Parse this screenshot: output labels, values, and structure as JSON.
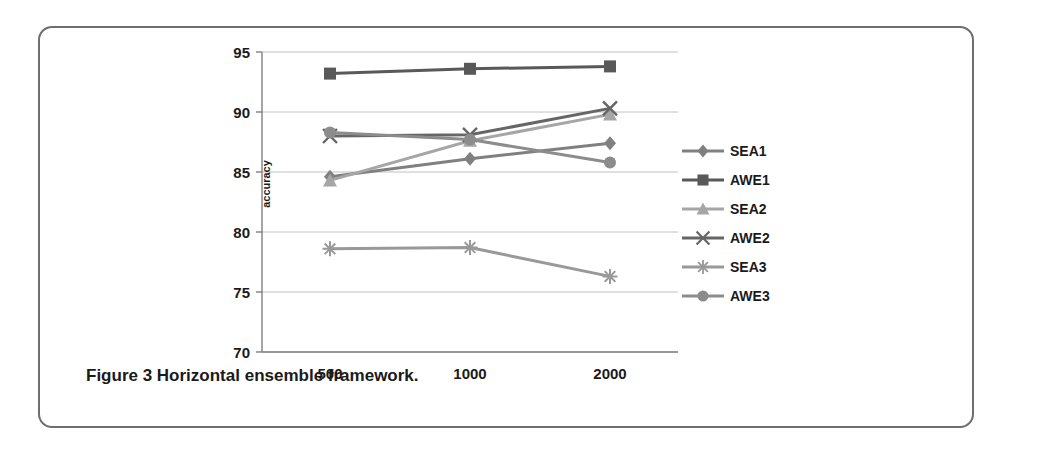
{
  "figure": {
    "caption": "Figure 3 Horizontal ensemble framework."
  },
  "colors": {
    "sea1": "#808080",
    "awe1": "#595959",
    "sea2": "#a6a6a6",
    "awe2": "#666666",
    "sea3": "#999999",
    "awe3": "#8c8c8c",
    "axis": "#808080",
    "grid": "#c0c0c0",
    "text": "#1a1a1a",
    "border": "#6e6e6e"
  },
  "chart_data": {
    "type": "line",
    "title": "",
    "xlabel": "",
    "ylabel": "accuracy",
    "categories": [
      "500",
      "1000",
      "2000"
    ],
    "x": [
      500,
      1000,
      2000
    ],
    "ylim": [
      70,
      95
    ],
    "yticks": [
      "70",
      "75",
      "80",
      "85",
      "90",
      "95"
    ],
    "xticks": [
      "500",
      "1000",
      "2000"
    ],
    "grid": true,
    "legend_position": "right",
    "series": [
      {
        "name": "SEA1",
        "marker": "diamond",
        "values": [
          84.6,
          86.1,
          87.4
        ]
      },
      {
        "name": "AWE1",
        "marker": "square",
        "values": [
          93.2,
          93.6,
          93.8
        ]
      },
      {
        "name": "SEA2",
        "marker": "triangle",
        "values": [
          84.3,
          87.6,
          89.8
        ]
      },
      {
        "name": "AWE2",
        "marker": "x",
        "values": [
          88.0,
          88.1,
          90.3
        ]
      },
      {
        "name": "SEA3",
        "marker": "asterisk",
        "values": [
          78.6,
          78.7,
          76.3
        ]
      },
      {
        "name": "AWE3",
        "marker": "circle",
        "values": [
          88.3,
          87.7,
          85.8
        ]
      }
    ]
  }
}
